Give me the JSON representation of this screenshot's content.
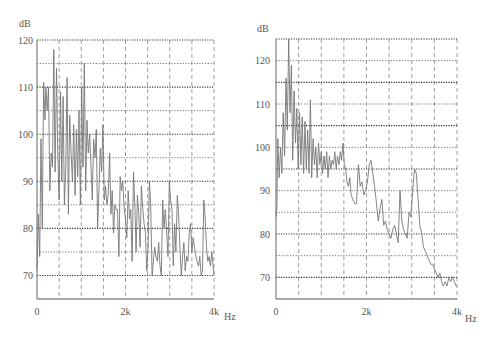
{
  "chart_data": [
    {
      "type": "line",
      "title": "",
      "ylabel": "dB",
      "xlabel": "Hz",
      "xlim": [
        0,
        4000
      ],
      "ylim": [
        65,
        120
      ],
      "x_ticks": [
        {
          "value": 0,
          "label": "0"
        },
        {
          "value": 2000,
          "label": "2k"
        },
        {
          "value": 4000,
          "label": "4k"
        }
      ],
      "y_ticks": [
        {
          "value": 120,
          "label": "120"
        },
        {
          "value": 110,
          "label": "110"
        },
        {
          "value": 100,
          "label": "100"
        },
        {
          "value": 90,
          "label": "90"
        },
        {
          "value": 80,
          "label": "80"
        },
        {
          "value": 70,
          "label": "70"
        }
      ],
      "grid": {
        "x_step": 500,
        "y_step": 5,
        "major_y": [
          120,
          110,
          100,
          90,
          80,
          70
        ],
        "minor_y": [
          115,
          105,
          95,
          85,
          75
        ]
      },
      "series": [
        {
          "name": "spectrum",
          "x": [
            0,
            30,
            60,
            90,
            120,
            150,
            180,
            200,
            230,
            260,
            290,
            320,
            350,
            380,
            410,
            440,
            470,
            500,
            530,
            560,
            590,
            620,
            650,
            680,
            710,
            740,
            770,
            800,
            830,
            860,
            890,
            920,
            950,
            980,
            1010,
            1040,
            1070,
            1100,
            1130,
            1160,
            1190,
            1220,
            1250,
            1280,
            1310,
            1340,
            1370,
            1400,
            1430,
            1460,
            1490,
            1520,
            1550,
            1580,
            1610,
            1640,
            1670,
            1700,
            1730,
            1760,
            1790,
            1820,
            1850,
            1880,
            1910,
            1940,
            1970,
            2000,
            2030,
            2060,
            2090,
            2120,
            2150,
            2180,
            2210,
            2240,
            2270,
            2300,
            2330,
            2360,
            2390,
            2420,
            2450,
            2480,
            2510,
            2540,
            2570,
            2600,
            2630,
            2660,
            2690,
            2720,
            2750,
            2780,
            2810,
            2840,
            2870,
            2900,
            2930,
            2960,
            2990,
            3020,
            3050,
            3080,
            3110,
            3140,
            3170,
            3200,
            3230,
            3260,
            3290,
            3320,
            3350,
            3380,
            3410,
            3440,
            3470,
            3500,
            3530,
            3560,
            3590,
            3620,
            3650,
            3680,
            3710,
            3740,
            3770,
            3800,
            3830,
            3860,
            3890,
            3920,
            3950,
            3980,
            4000
          ],
          "values": [
            71,
            83,
            74,
            99,
            80,
            111,
            103,
            110,
            105,
            110,
            88,
            96,
            93,
            118,
            92,
            114,
            96,
            86,
            109,
            90,
            108,
            85,
            93,
            112,
            83,
            104,
            96,
            90,
            102,
            87,
            101,
            91,
            105,
            85,
            110,
            93,
            115,
            88,
            103,
            96,
            100,
            93,
            86,
            99,
            95,
            101,
            80,
            88,
            97,
            92,
            102,
            86,
            89,
            85,
            87,
            96,
            83,
            88,
            79,
            85,
            84,
            84,
            74,
            91,
            88,
            90,
            84,
            82,
            78,
            88,
            82,
            84,
            73,
            92,
            85,
            75,
            87,
            83,
            76,
            89,
            84,
            81,
            79,
            71,
            76,
            90,
            85,
            70,
            73,
            76,
            74,
            73,
            77,
            72,
            70,
            86,
            80,
            84,
            79,
            74,
            90,
            86,
            84,
            72,
            81,
            75,
            87,
            83,
            76,
            70,
            74,
            77,
            71,
            74,
            73,
            79,
            81,
            75,
            78,
            76,
            74,
            73,
            72,
            74,
            70,
            71,
            86,
            82,
            76,
            73,
            74,
            72,
            75,
            72,
            70,
            70
          ]
        }
      ]
    },
    {
      "type": "line",
      "title": "",
      "ylabel": "dB",
      "xlabel": "Hz",
      "xlim": [
        0,
        4000
      ],
      "ylim": [
        65,
        125
      ],
      "x_ticks": [
        {
          "value": 0,
          "label": "0"
        },
        {
          "value": 2000,
          "label": "2k"
        },
        {
          "value": 4000,
          "label": "4k"
        }
      ],
      "y_ticks": [
        {
          "value": 120,
          "label": "120"
        },
        {
          "value": 110,
          "label": "110"
        },
        {
          "value": 100,
          "label": "100"
        },
        {
          "value": 90,
          "label": "90"
        },
        {
          "value": 80,
          "label": "80"
        },
        {
          "value": 70,
          "label": "70"
        }
      ],
      "grid": {
        "x_step": 500,
        "y_step": 5,
        "major_y": [
          125,
          115,
          105,
          95,
          80,
          70
        ],
        "minor_y": [
          120,
          110,
          100,
          90,
          85,
          75
        ]
      },
      "series": [
        {
          "name": "spectrum",
          "x": [
            0,
            20,
            40,
            70,
            100,
            130,
            160,
            190,
            220,
            250,
            280,
            310,
            340,
            370,
            400,
            430,
            460,
            490,
            520,
            550,
            580,
            610,
            640,
            670,
            700,
            730,
            760,
            790,
            820,
            850,
            880,
            910,
            940,
            970,
            1000,
            1030,
            1060,
            1090,
            1120,
            1150,
            1180,
            1210,
            1240,
            1270,
            1300,
            1330,
            1360,
            1390,
            1420,
            1450,
            1480,
            1510,
            1540,
            1570,
            1600,
            1630,
            1660,
            1700,
            1740,
            1780,
            1820,
            1860,
            1900,
            1940,
            1980,
            2020,
            2060,
            2100,
            2140,
            2180,
            2220,
            2260,
            2300,
            2340,
            2380,
            2420,
            2460,
            2500,
            2540,
            2580,
            2620,
            2660,
            2700,
            2740,
            2780,
            2820,
            2860,
            2900,
            2940,
            2980,
            3020,
            3060,
            3100,
            3140,
            3180,
            3220,
            3260,
            3300,
            3340,
            3380,
            3420,
            3460,
            3500,
            3540,
            3580,
            3620,
            3660,
            3700,
            3740,
            3780,
            3820,
            3860,
            3900,
            3940,
            3980,
            4000
          ],
          "values": [
            84,
            86,
            102,
            93,
            100,
            94,
            108,
            98,
            116,
            104,
            125,
            108,
            119,
            97,
            113,
            101,
            109,
            95,
            108,
            96,
            107,
            94,
            106,
            95,
            104,
            94,
            111,
            93,
            102,
            96,
            100,
            93,
            101,
            96,
            99,
            94,
            98,
            95,
            99,
            93,
            98,
            95,
            97,
            96,
            99,
            95,
            98,
            96,
            99,
            97,
            101,
            96,
            95,
            92,
            91,
            93,
            89,
            88,
            87,
            87,
            96,
            91,
            92,
            89,
            90,
            92,
            96,
            97,
            94,
            91,
            87,
            83,
            86,
            88,
            82,
            83,
            81,
            80,
            79,
            81,
            82,
            80,
            78,
            90,
            83,
            81,
            80,
            79,
            85,
            84,
            90,
            95,
            94,
            88,
            82,
            80,
            77,
            76,
            75,
            74,
            73,
            73,
            72,
            71,
            70,
            71,
            69,
            68,
            69,
            68,
            70,
            69,
            70,
            69,
            68,
            68,
            68
          ]
        }
      ]
    }
  ]
}
